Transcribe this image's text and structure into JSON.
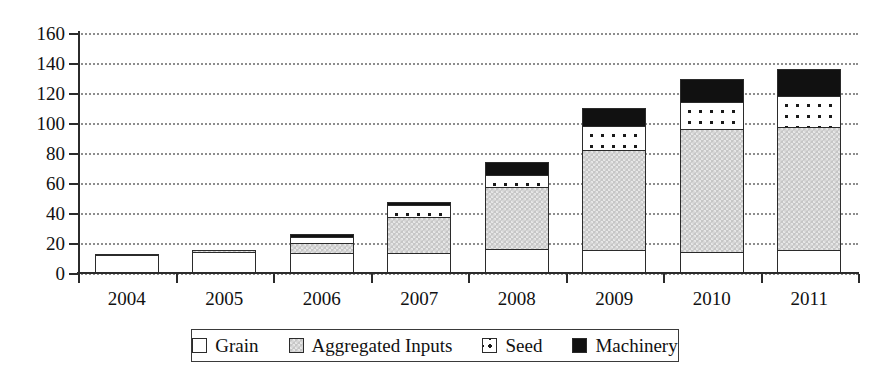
{
  "chart_data": {
    "type": "bar",
    "stacked": true,
    "title": "",
    "xlabel": "",
    "ylabel": "",
    "ylim": [
      0,
      160
    ],
    "ytick_step": 20,
    "yticks": [
      0,
      20,
      40,
      60,
      80,
      100,
      120,
      140,
      160
    ],
    "grid": true,
    "grid_style": "dotted-horizontal",
    "legend_position": "bottom",
    "categories": [
      "2004",
      "2005",
      "2006",
      "2007",
      "2008",
      "2009",
      "2010",
      "2011"
    ],
    "series": [
      {
        "name": "Grain",
        "fill": "white",
        "color": "#ffffff",
        "values": [
          13,
          15,
          14,
          14,
          17,
          16,
          15,
          16
        ]
      },
      {
        "name": "Aggregated Inputs",
        "fill": "gray",
        "color": "#c6c6c6",
        "values": [
          1,
          2,
          8,
          25,
          42,
          68,
          83,
          83
        ]
      },
      {
        "name": "Seed",
        "fill": "dotted",
        "color": "#ffffff",
        "values": [
          0,
          0,
          5,
          9,
          9,
          17,
          19,
          22
        ]
      },
      {
        "name": "Machinery",
        "fill": "black",
        "color": "#111111",
        "values": [
          1,
          1,
          3,
          3,
          10,
          13,
          16,
          19
        ]
      }
    ],
    "totals": [
      15,
      18,
      30,
      51,
      78,
      114,
      133,
      140
    ]
  },
  "axis": {
    "y_labels": [
      "0",
      "20",
      "40",
      "60",
      "80",
      "100",
      "120",
      "140",
      "160"
    ],
    "x_labels": [
      "2004",
      "2005",
      "2006",
      "2007",
      "2008",
      "2009",
      "2010",
      "2011"
    ]
  },
  "legend": {
    "items": [
      {
        "label": "Grain",
        "swatch": "white-square-icon"
      },
      {
        "label": "Aggregated Inputs",
        "swatch": "gray-square-icon"
      },
      {
        "label": "Seed",
        "swatch": "dotted-square-icon"
      },
      {
        "label": "Machinery",
        "swatch": "black-square-icon"
      }
    ]
  }
}
